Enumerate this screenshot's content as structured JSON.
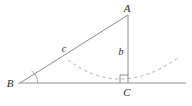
{
  "figure": {
    "canvas": {
      "width": 192,
      "height": 106,
      "background": "#ffffff"
    },
    "colors": {
      "line": "#8a8a8a",
      "baseline": "#909090",
      "dashed_curve": "#b0b0b0",
      "angle_arc": "#9a9a9a",
      "label_text": "#2b2b2b"
    },
    "vertices": [
      {
        "name": "A",
        "label": "A",
        "x": 128,
        "y": 15,
        "label_x": 127,
        "label_y": 12
      },
      {
        "name": "B",
        "label": "B",
        "x": 20,
        "y": 83,
        "label_x": 10,
        "label_y": 87
      },
      {
        "name": "C",
        "label": "C",
        "x": 128,
        "y": 83,
        "label_x": 125,
        "label_y": 96
      }
    ],
    "sides": [
      {
        "name": "hypotenuse",
        "label": "c",
        "from": "B",
        "to": "A",
        "label_x": 64,
        "label_y": 52
      },
      {
        "name": "vertical-leg",
        "label": "b",
        "from": "A",
        "to": "C",
        "label_x": 122,
        "label_y": 55
      }
    ],
    "markers": {
      "right_angle_at": "C",
      "right_angle_size": 8,
      "angle_arc_at": "B",
      "angle_arc_radius": 18
    },
    "baseline": {
      "x1": 18,
      "y1": 83,
      "x2": 186,
      "y2": 83
    },
    "dashed_curve": {
      "type": "parabola",
      "vertex_x": 120,
      "vertex_y": 83,
      "start_x": 68,
      "start_y": 60,
      "end_x": 178,
      "end_y": 58
    }
  }
}
